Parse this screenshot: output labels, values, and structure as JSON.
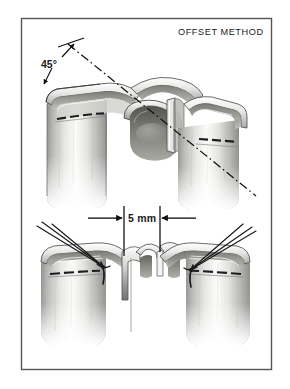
{
  "figure": {
    "title": "OFFSET METHOD",
    "kind": "surgical-anastomosis-illustration",
    "frame": {
      "x": 21,
      "y": 18,
      "width": 251,
      "height": 352,
      "border_color": "#555555",
      "background_color": "#ffffff"
    },
    "panels": [
      {
        "name": "upper-panel",
        "caption": "",
        "annotations": {
          "angle_label": "45°",
          "axis_style": "dash-dot"
        }
      },
      {
        "name": "lower-panel",
        "caption": "",
        "annotations": {
          "dimension_label": "5 mm",
          "dimension_style": "double-arrow-inward"
        }
      }
    ],
    "annotations": {
      "angle": "45°",
      "distance": "5 mm"
    },
    "colors": {
      "ink": "#111111",
      "frame": "#555555",
      "tissue_light": "#f2f2f1",
      "tissue_mid": "#c9c9c7",
      "tissue_dark": "#8d8d8a",
      "tissue_shadow": "#5a5a58",
      "suture": "#16181a",
      "background": "#ffffff"
    }
  }
}
